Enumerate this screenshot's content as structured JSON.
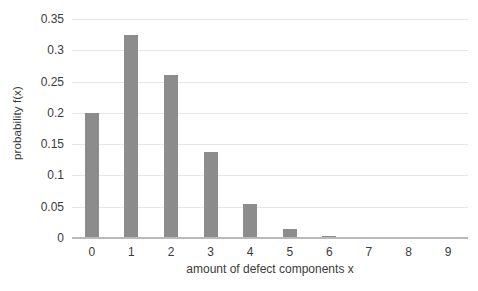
{
  "chart_data": {
    "type": "bar",
    "title": "",
    "xlabel": "amount of defect components x",
    "ylabel": "probability f(x)",
    "categories": [
      "0",
      "1",
      "2",
      "3",
      "4",
      "5",
      "6",
      "7",
      "8",
      "9"
    ],
    "values": [
      0.2,
      0.325,
      0.261,
      0.138,
      0.054,
      0.015,
      0.004,
      0.001,
      0.001,
      0.001
    ],
    "series": [
      {
        "name": "probability f(x)",
        "values": [
          0.2,
          0.325,
          0.261,
          0.138,
          0.054,
          0.015,
          0.004,
          0.001,
          0.001,
          0.001
        ]
      }
    ],
    "ylim": [
      0,
      0.35
    ],
    "xlim": [
      0,
      9
    ],
    "y_ticks": [
      0,
      0.05,
      0.1,
      0.15,
      0.2,
      0.25,
      0.3,
      0.35
    ],
    "y_tick_labels": [
      "0",
      "0.05",
      "0.1",
      "0.15",
      "0.2",
      "0.25",
      "0.3",
      "0.35"
    ],
    "x_tick_labels": [
      "0",
      "1",
      "2",
      "3",
      "4",
      "5",
      "6",
      "7",
      "8",
      "9"
    ],
    "grid": true,
    "grid_axis": "y",
    "legend": false,
    "legend_position": "none",
    "bar_color": "#8c8c8c",
    "gridline_color": "#e6e6e6",
    "axis_color": "#b9b9b9",
    "background_color": "#ffffff",
    "text_color": "#3b3b3b"
  }
}
